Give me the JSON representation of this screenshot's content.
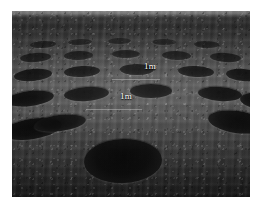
{
  "figure": {
    "kind": "photograph",
    "alt": "Black and white photograph of a ploughed field with many dark circular pits arranged in rows receding to the horizon",
    "border_color": "#ffffff",
    "photo": {
      "x": 12,
      "y": 11,
      "width": 238,
      "height": 186,
      "palette": {
        "horizon_light": "#9a9a9a",
        "soil_mid": "#5a5a5a",
        "soil_far": "#2e2e2e",
        "soil_near": "#1c1c1c",
        "pit_dark": "#050505",
        "label_text": "#ffffff"
      }
    }
  },
  "annotations": {
    "labels": [
      {
        "id": "scale-1",
        "text": "1m",
        "x": 144,
        "y": 62
      },
      {
        "id": "scale-2",
        "text": "1m",
        "x": 120,
        "y": 92
      }
    ]
  },
  "pits": [
    {
      "id": "pit-r1-a",
      "left": 18,
      "top": 30,
      "w": 26,
      "h": 7,
      "rot": -3,
      "op": 0.6
    },
    {
      "id": "pit-r1-b",
      "left": 56,
      "top": 28,
      "w": 24,
      "h": 6,
      "rot": -2,
      "op": 0.55
    },
    {
      "id": "pit-r1-c",
      "left": 96,
      "top": 27,
      "w": 23,
      "h": 6,
      "rot": -1,
      "op": 0.52
    },
    {
      "id": "pit-r1-d",
      "left": 140,
      "top": 28,
      "w": 24,
      "h": 6,
      "rot": 1,
      "op": 0.55
    },
    {
      "id": "pit-r1-e",
      "left": 182,
      "top": 30,
      "w": 25,
      "h": 7,
      "rot": 2,
      "op": 0.58
    },
    {
      "id": "pit-r2-a",
      "left": 8,
      "top": 42,
      "w": 31,
      "h": 9,
      "rot": -4,
      "op": 0.72
    },
    {
      "id": "pit-r2-b",
      "left": 52,
      "top": 40,
      "w": 29,
      "h": 9,
      "rot": -2,
      "op": 0.7
    },
    {
      "id": "pit-r2-c",
      "left": 100,
      "top": 39,
      "w": 28,
      "h": 8,
      "rot": 0,
      "op": 0.68
    },
    {
      "id": "pit-r2-d",
      "left": 150,
      "top": 40,
      "w": 29,
      "h": 9,
      "rot": 2,
      "op": 0.7
    },
    {
      "id": "pit-r2-e",
      "left": 198,
      "top": 42,
      "w": 31,
      "h": 9,
      "rot": 4,
      "op": 0.72
    },
    {
      "id": "pit-r3-a",
      "left": 2,
      "top": 58,
      "w": 38,
      "h": 12,
      "rot": -5,
      "op": 0.85
    },
    {
      "id": "pit-r3-b",
      "left": 52,
      "top": 55,
      "w": 36,
      "h": 11,
      "rot": -3,
      "op": 0.84
    },
    {
      "id": "pit-r3-c",
      "left": 108,
      "top": 53,
      "w": 34,
      "h": 11,
      "rot": 0,
      "op": 0.82
    },
    {
      "id": "pit-r3-d",
      "left": 166,
      "top": 55,
      "w": 36,
      "h": 11,
      "rot": 3,
      "op": 0.84
    },
    {
      "id": "pit-r3-e",
      "left": 214,
      "top": 58,
      "w": 34,
      "h": 12,
      "rot": 5,
      "op": 0.85
    },
    {
      "id": "pit-r4-a",
      "left": -6,
      "top": 80,
      "w": 48,
      "h": 15,
      "rot": -7,
      "op": 0.93
    },
    {
      "id": "pit-r4-b",
      "left": 52,
      "top": 76,
      "w": 45,
      "h": 14,
      "rot": -4,
      "op": 0.92
    },
    {
      "id": "pit-r4-c",
      "left": 118,
      "top": 73,
      "w": 42,
      "h": 14,
      "rot": 0,
      "op": 0.95
    },
    {
      "id": "pit-r4-d",
      "left": 186,
      "top": 76,
      "w": 44,
      "h": 14,
      "rot": 4,
      "op": 0.92
    },
    {
      "id": "pit-r4-e",
      "left": 228,
      "top": 82,
      "w": 40,
      "h": 16,
      "rot": 7,
      "op": 0.92
    },
    {
      "id": "pit-r5-a",
      "left": -10,
      "top": 108,
      "w": 60,
      "h": 20,
      "rot": -9,
      "op": 0.96
    },
    {
      "id": "pit-r5-b",
      "left": 22,
      "top": 104,
      "w": 52,
      "h": 16,
      "rot": -7,
      "op": 0.94
    },
    {
      "id": "pit-r5-c",
      "left": 196,
      "top": 100,
      "w": 58,
      "h": 22,
      "rot": 8,
      "op": 0.95
    },
    {
      "id": "pit-foreground",
      "left": 72,
      "top": 128,
      "w": 78,
      "h": 44,
      "rot": -2,
      "op": 0.98
    }
  ]
}
